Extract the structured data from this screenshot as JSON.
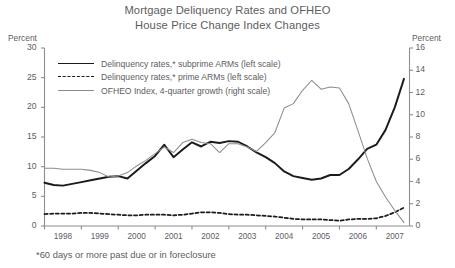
{
  "title": {
    "line1": "Mortgage Deliquency Rates and OFHEO",
    "line2": "House Price Change Index Changes"
  },
  "axes": {
    "left_unit": "Percent",
    "right_unit": "Percent",
    "left_ticks": [
      "30",
      "25",
      "20",
      "15",
      "10",
      "5",
      "0"
    ],
    "right_ticks": [
      "16",
      "14",
      "12",
      "10",
      "8",
      "6",
      "4",
      "2",
      "0"
    ],
    "x_ticks": [
      "1998",
      "1999",
      "2000",
      "2001",
      "2002",
      "2003",
      "2004",
      "2005",
      "2006",
      "2007"
    ]
  },
  "legend": {
    "items": [
      {
        "label": "Delinquency rates,* subprime ARMs (left scale)",
        "style": "solid-black",
        "swatch": "thick-solid-black-line-icon"
      },
      {
        "label": "Delinquency rates,* prime ARMs (left scale)",
        "style": "dashed-black",
        "swatch": "dashed-black-line-icon"
      },
      {
        "label": "OFHEO Index, 4-quarter growth (right scale)",
        "style": "solid-gray",
        "swatch": "thin-gray-line-icon"
      }
    ]
  },
  "footnote": "*60 days or more past due or in foreclosure",
  "colors": {
    "subprime": "#1b1b1b",
    "prime": "#1b1b1b",
    "ofheo": "#8d8d8f",
    "axis": "#8d8d8f",
    "text": "#5d5d5f"
  },
  "chart_data": {
    "type": "line",
    "title": "Mortgage Deliquency Rates and OFHEO House Price Change Index Changes",
    "subtitle": "",
    "xlabel": "",
    "ylabel": "Percent",
    "y2label": "Percent",
    "ylim": [
      0,
      30
    ],
    "y2lim": [
      0,
      16
    ],
    "xlim": [
      1998.0,
      2007.9
    ],
    "grid": false,
    "legend_position": "upper-left-inside",
    "annotations": [
      "*60 days or more past due or in foreclosure"
    ],
    "x_tick_labels": [
      "1998",
      "1999",
      "2000",
      "2001",
      "2002",
      "2003",
      "2004",
      "2005",
      "2006",
      "2007"
    ],
    "series": [
      {
        "name": "Delinquency rates,* subprime ARMs (left scale)",
        "axis": "left",
        "unit": "percent",
        "style": "solid",
        "color": "#1b1b1b",
        "x": [
          1998.0,
          1998.25,
          1998.5,
          1998.75,
          1999.0,
          1999.25,
          1999.5,
          1999.75,
          2000.0,
          2000.25,
          2000.5,
          2000.75,
          2001.0,
          2001.25,
          2001.5,
          2001.75,
          2002.0,
          2002.25,
          2002.5,
          2002.75,
          2003.0,
          2003.25,
          2003.5,
          2003.75,
          2004.0,
          2004.25,
          2004.5,
          2004.75,
          2005.0,
          2005.25,
          2005.5,
          2005.75,
          2006.0,
          2006.25,
          2006.5,
          2006.75,
          2007.0,
          2007.25,
          2007.5,
          2007.75
        ],
        "y": [
          7.3,
          6.9,
          6.8,
          7.1,
          7.4,
          7.7,
          8.0,
          8.3,
          8.4,
          8.0,
          9.3,
          10.6,
          11.8,
          13.7,
          11.6,
          12.9,
          14.1,
          13.4,
          14.2,
          14.0,
          14.3,
          14.2,
          13.4,
          12.4,
          11.6,
          10.6,
          9.2,
          8.4,
          8.1,
          7.8,
          8.0,
          8.6,
          8.6,
          9.6,
          11.2,
          13.0,
          13.7,
          16.2,
          20.0,
          24.8
        ]
      },
      {
        "name": "Delinquency rates,* prime ARMs (left scale)",
        "axis": "left",
        "unit": "percent",
        "style": "dashed",
        "color": "#1b1b1b",
        "x": [
          1998.0,
          1998.25,
          1998.5,
          1998.75,
          1999.0,
          1999.25,
          1999.5,
          1999.75,
          2000.0,
          2000.25,
          2000.5,
          2000.75,
          2001.0,
          2001.25,
          2001.5,
          2001.75,
          2002.0,
          2002.25,
          2002.5,
          2002.75,
          2003.0,
          2003.25,
          2003.5,
          2003.75,
          2004.0,
          2004.25,
          2004.5,
          2004.75,
          2005.0,
          2005.25,
          2005.5,
          2005.75,
          2006.0,
          2006.25,
          2006.5,
          2006.75,
          2007.0,
          2007.25,
          2007.5,
          2007.75
        ],
        "y": [
          2.0,
          2.1,
          2.1,
          2.1,
          2.2,
          2.2,
          2.1,
          2.0,
          1.9,
          1.8,
          1.8,
          1.9,
          1.9,
          1.9,
          1.8,
          1.9,
          2.1,
          2.3,
          2.3,
          2.2,
          2.0,
          1.9,
          1.9,
          1.8,
          1.7,
          1.6,
          1.4,
          1.2,
          1.1,
          1.1,
          1.1,
          1.0,
          0.9,
          1.1,
          1.2,
          1.2,
          1.3,
          1.7,
          2.3,
          3.1
        ]
      },
      {
        "name": "OFHEO Index, 4-quarter growth (right scale)",
        "axis": "right",
        "unit": "percent",
        "style": "solid",
        "color": "#8d8d8f",
        "x": [
          1998.0,
          1998.25,
          1998.5,
          1998.75,
          1999.0,
          1999.25,
          1999.5,
          1999.75,
          2000.0,
          2000.25,
          2000.5,
          2000.75,
          2001.0,
          2001.25,
          2001.5,
          2001.75,
          2002.0,
          2002.25,
          2002.5,
          2002.75,
          2003.0,
          2003.25,
          2003.5,
          2003.75,
          2004.0,
          2004.25,
          2004.5,
          2004.75,
          2005.0,
          2005.25,
          2005.5,
          2005.75,
          2006.0,
          2006.25,
          2006.5,
          2006.75,
          2007.0,
          2007.25,
          2007.5,
          2007.75
        ],
        "y": [
          5.2,
          5.2,
          5.1,
          5.1,
          5.1,
          5.0,
          4.8,
          4.4,
          4.5,
          4.8,
          5.4,
          5.9,
          6.5,
          7.1,
          6.6,
          7.5,
          7.8,
          7.5,
          7.4,
          6.6,
          7.4,
          7.4,
          7.1,
          6.7,
          7.5,
          8.4,
          10.6,
          11.0,
          12.2,
          13.1,
          12.3,
          12.5,
          12.4,
          11.0,
          8.6,
          6.1,
          4.0,
          2.6,
          1.4,
          0.3
        ]
      }
    ]
  }
}
